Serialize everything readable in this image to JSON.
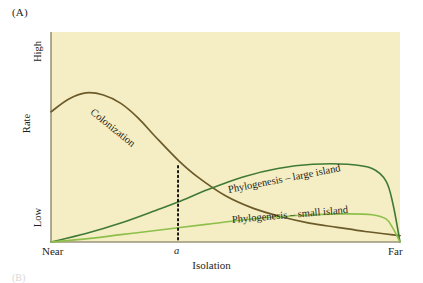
{
  "figure": {
    "panel_label": "(A)",
    "next_panel_label": "(B)"
  },
  "axes": {
    "y_title": "Rate",
    "y_tick_top": "High",
    "y_tick_bottom": "Low",
    "x_title": "Isolation",
    "x_tick_left": "Near",
    "x_tick_mid": "a",
    "x_tick_right": "Far"
  },
  "labels": {
    "colonization": "Colonization",
    "phylogenesis_large": "Phylogenesis – large island",
    "phylogenesis_small": "Phylogenesis – small island"
  },
  "colors": {
    "plot_background": "#f5edc4",
    "colonization_curve": "#6b5b2a",
    "large_island_curve": "#3f7a35",
    "small_island_curve": "#8dbf4a",
    "axis": "#9a9478",
    "marker_line": "#000000",
    "text": "#231f20"
  },
  "chart_data": {
    "type": "line",
    "title": "(A)",
    "xlabel": "Isolation",
    "ylabel": "Rate",
    "xlim": [
      "Near",
      "Far"
    ],
    "ylim": [
      "Low",
      "High"
    ],
    "grid": false,
    "legend": "inline-curve-labels",
    "annotations": [
      {
        "type": "vertical-dotted-line",
        "x_label": "a",
        "x_fraction": 0.364,
        "description": "isolation value a where colonization rate equals phylogenesis rate on a large island"
      }
    ],
    "series": [
      {
        "name": "Colonization",
        "color": "#6b5b2a",
        "x": [
          0.0,
          0.05,
          0.1,
          0.15,
          0.2,
          0.25,
          0.3,
          0.364,
          0.42,
          0.5,
          0.58,
          0.66,
          0.74,
          0.82,
          0.9,
          1.0
        ],
        "y": [
          0.62,
          0.68,
          0.71,
          0.7,
          0.66,
          0.59,
          0.5,
          0.39,
          0.31,
          0.22,
          0.16,
          0.12,
          0.09,
          0.07,
          0.05,
          0.03
        ]
      },
      {
        "name": "Phylogenesis – large island",
        "color": "#3f7a35",
        "x": [
          0.0,
          0.1,
          0.2,
          0.3,
          0.364,
          0.45,
          0.55,
          0.65,
          0.75,
          0.85,
          0.92,
          0.96,
          0.98,
          1.0
        ],
        "y": [
          0.0,
          0.04,
          0.09,
          0.15,
          0.19,
          0.25,
          0.31,
          0.35,
          0.37,
          0.37,
          0.35,
          0.29,
          0.18,
          0.0
        ]
      },
      {
        "name": "Phylogenesis – small island",
        "color": "#8dbf4a",
        "x": [
          0.0,
          0.1,
          0.2,
          0.3,
          0.364,
          0.45,
          0.55,
          0.65,
          0.75,
          0.85,
          0.92,
          0.96,
          0.98,
          1.0
        ],
        "y": [
          0.0,
          0.015,
          0.035,
          0.055,
          0.068,
          0.085,
          0.105,
          0.12,
          0.13,
          0.134,
          0.13,
          0.11,
          0.065,
          0.0
        ]
      }
    ]
  }
}
